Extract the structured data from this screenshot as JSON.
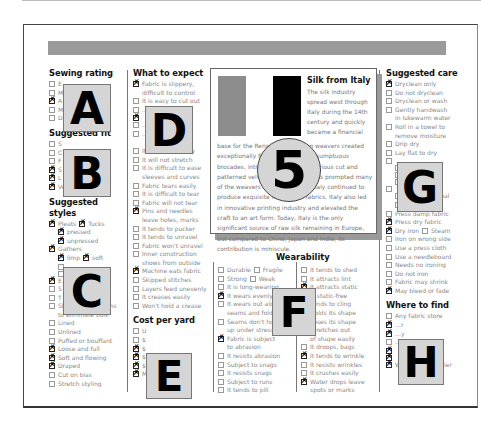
{
  "page": {
    "header_bar_color": "#9a9a9a"
  },
  "sewing_rating": {
    "title": "Sewing rating",
    "items": [
      {
        "label": "E",
        "checked": false
      },
      {
        "label": "M",
        "checked": false
      },
      {
        "label": "A",
        "checked": true
      },
      {
        "label": "M…ut",
        "checked": false
      },
      {
        "label": "D…s",
        "checked": false
      }
    ]
  },
  "suggested_fit": {
    "title": "Suggested fit",
    "items": [
      {
        "label": "S",
        "checked": false
      },
      {
        "label": "C",
        "checked": false
      },
      {
        "label": "F",
        "checked": false
      },
      {
        "label": "S",
        "checked": true
      },
      {
        "label": "L",
        "checked": true
      },
      {
        "label": "Very loose fitting",
        "checked": true
      }
    ]
  },
  "suggested_styles": {
    "title": "Suggested styles",
    "items": [
      {
        "label": "Pleats",
        "checked": true,
        "pair": {
          "label": "Tucks",
          "checked": true
        }
      },
      {
        "label": "pressed",
        "checked": true,
        "indent": true
      },
      {
        "label": "unpressed",
        "checked": true,
        "indent": true
      },
      {
        "label": "Gathers",
        "checked": true
      },
      {
        "label": "limp",
        "checked": true,
        "indent": true,
        "pair": {
          "label": "soft",
          "checked": true
        }
      },
      {
        "label": "",
        "checked": false,
        "indent": true
      },
      {
        "label": "",
        "checked": false,
        "indent": true
      },
      {
        "label": "E…ng",
        "checked": true
      },
      {
        "label": "S",
        "checked": false
      },
      {
        "label": "T",
        "checked": false
      },
      {
        "label": "Shaped with seams",
        "checked": false,
        "cont": "to eliminate bulk"
      },
      {
        "label": "Lined",
        "checked": false
      },
      {
        "label": "Unlined",
        "checked": false
      },
      {
        "label": "Puffed or bouffant",
        "checked": false
      },
      {
        "label": "Loose and full",
        "checked": true
      },
      {
        "label": "Soft and flowing",
        "checked": true
      },
      {
        "label": "Draped",
        "checked": true
      },
      {
        "label": "Cut on bias",
        "checked": false
      },
      {
        "label": "Stretch styling",
        "checked": false
      }
    ]
  },
  "what_to_expect": {
    "title": "What to expect",
    "items": [
      {
        "label": "Fabric is slippery,",
        "checked": true,
        "cont": "difficult to control"
      },
      {
        "label": "It is easy to cut out",
        "checked": false
      },
      {
        "label": "…ut",
        "checked": false
      },
      {
        "label": "",
        "checked": true
      },
      {
        "label": "…te",
        "checked": false
      },
      {
        "label": "…ric",
        "checked": false,
        "cont": ""
      },
      {
        "label": "It stretches easily",
        "checked": false
      },
      {
        "label": "It will not stretch",
        "checked": false
      },
      {
        "label": "It is difficult to ease",
        "checked": false,
        "cont": "sleeves and curves"
      },
      {
        "label": "Fabric tears easily",
        "checked": false
      },
      {
        "label": "It is difficult to tear",
        "checked": false
      },
      {
        "label": "Fabric will not tear",
        "checked": false
      },
      {
        "label": "Pins and needles",
        "checked": true,
        "cont": "leave holes, marks"
      },
      {
        "label": "It tends to pucker",
        "checked": false
      },
      {
        "label": "It tends to unravel",
        "checked": false
      },
      {
        "label": "Fabric won't unravel",
        "checked": false
      },
      {
        "label": "Inner construction",
        "checked": false,
        "cont": "shows from outside"
      },
      {
        "label": "Machine eats fabric",
        "checked": true
      },
      {
        "label": "Skipped stitches",
        "checked": false
      },
      {
        "label": "Layers feed unevenly",
        "checked": false
      },
      {
        "label": "It creases easily",
        "checked": false
      },
      {
        "label": "Won't hold a crease",
        "checked": false
      }
    ]
  },
  "cost_per_yard": {
    "title": "Cost per yard",
    "items": [
      {
        "label": "U",
        "checked": false
      },
      {
        "label": "$",
        "checked": false
      },
      {
        "label": "$",
        "checked": true
      },
      {
        "label": "$",
        "checked": true
      },
      {
        "label": "$",
        "checked": true
      },
      {
        "label": "More than $50",
        "checked": true
      }
    ]
  },
  "feature": {
    "title": "Silk from Italy",
    "flag_colors": [
      "#8c8c8c",
      "#ffffff",
      "#000000"
    ],
    "intro": "The silk industry spread west through Italy during the 14th century and quickly became a financial",
    "body": "base for the Renaissance. Italian weavers created exceptionally fine silks, including sumptuous brocades, intricate jacquards, luxurious cut and patterned velvets. Wars and politics prompted many of the weavers to emigrate, but Italy continued to produce exquisite fine woven fabrics. Italy also led in innovative printing industry and elevated the craft to an art form. Today, Italy is the only significant source of raw silk remaining in Europe, but compared to China, Japan and India, its contribution is miniscule."
  },
  "wearability": {
    "title": "Wearability",
    "left": [
      {
        "label": "Durable",
        "checked": false,
        "pair": {
          "label": "Fragile",
          "checked": false
        }
      },
      {
        "label": "Strong",
        "checked": false,
        "pair": {
          "label": "Weak",
          "checked": false
        }
      },
      {
        "label": "It is long-wearing",
        "checked": false
      },
      {
        "label": "It wears evenly",
        "checked": true
      },
      {
        "label": "It wears out along",
        "checked": false,
        "cont": "seams and folds"
      },
      {
        "label": "Seams don't hold",
        "checked": false,
        "cont": "up under stress"
      },
      {
        "label": "Fabric is subject",
        "checked": true,
        "cont": "to abrasion"
      },
      {
        "label": "It resists abrasion",
        "checked": false
      },
      {
        "label": "Subject to snags",
        "checked": false
      },
      {
        "label": "It resists snags",
        "checked": false
      },
      {
        "label": "Subject to runs",
        "checked": false
      },
      {
        "label": "It tends to pill",
        "checked": false
      }
    ],
    "right": [
      {
        "label": "It tends to shed",
        "checked": false
      },
      {
        "label": "It attracts lint",
        "checked": false
      },
      {
        "label": "It attracts static",
        "checked": true
      },
      {
        "label": "Is static-free",
        "checked": false
      },
      {
        "label": "Tends to cling",
        "checked": true
      },
      {
        "label": "Holds its shape",
        "checked": true
      },
      {
        "label": "Loses its shape",
        "checked": false
      },
      {
        "label": "Stretches out",
        "checked": false,
        "cont": "of shape easily"
      },
      {
        "label": "It droops, bags",
        "checked": false
      },
      {
        "label": "It tends to wrinkle",
        "checked": true
      },
      {
        "label": "It resists wrinkles",
        "checked": false
      },
      {
        "label": "It crushes easily",
        "checked": false
      },
      {
        "label": "Water drops leave",
        "checked": true,
        "cont": "spots or marks"
      }
    ]
  },
  "suggested_care": {
    "title": "Suggested care",
    "items": [
      {
        "label": "Dryclean only",
        "checked": true
      },
      {
        "label": "Do not dryclean",
        "checked": false
      },
      {
        "label": "Dryclean or wash",
        "checked": false
      },
      {
        "label": "Gently handwash",
        "checked": false,
        "cont": "in lukewarm water"
      },
      {
        "label": "Roll in a towel to",
        "checked": false,
        "cont": "remove moisture"
      },
      {
        "label": "Drip dry",
        "checked": false
      },
      {
        "label": "Lay flat to dry",
        "checked": false
      },
      {
        "label": "",
        "checked": false
      },
      {
        "label": "",
        "checked": false,
        "indent": true
      },
      {
        "label": "",
        "checked": false,
        "indent": true
      },
      {
        "label": "",
        "checked": false,
        "indent": true
      },
      {
        "label": "",
        "checked": false
      },
      {
        "label": "cool",
        "checked": false,
        "indent": true,
        "pair": {
          "label": "normal",
          "checked": false
        }
      },
      {
        "label": "perm. press",
        "checked": false,
        "indent": true
      },
      {
        "label": "Press damp fabric",
        "checked": false
      },
      {
        "label": "Press dry fabric",
        "checked": true
      },
      {
        "label": "Dry iron",
        "checked": true,
        "pair": {
          "label": "Steam",
          "checked": false
        }
      },
      {
        "label": "Iron on wrong side",
        "checked": false
      },
      {
        "label": "Use a press cloth",
        "checked": false
      },
      {
        "label": "Use a needleboard",
        "checked": false
      },
      {
        "label": "Needs no ironing",
        "checked": false
      },
      {
        "label": "Do not iron",
        "checked": false
      },
      {
        "label": "Fabric may shrink",
        "checked": false
      },
      {
        "label": "May bleed or fade",
        "checked": true
      }
    ]
  },
  "where_to_find": {
    "title": "Where to find",
    "items": [
      {
        "label": "Any fabric store",
        "checked": false
      },
      {
        "label": "…r",
        "checked": true
      },
      {
        "label": "…y",
        "checked": true
      },
      {
        "label": "…c",
        "checked": false,
        "blank": true
      },
      {
        "label": "",
        "checked": true
      },
      {
        "label": "",
        "checked": true
      },
      {
        "label": "Wholesale supplier",
        "checked": true
      }
    ]
  },
  "overlays": [
    {
      "label": "A"
    },
    {
      "label": "B"
    },
    {
      "label": "C"
    },
    {
      "label": "D"
    },
    {
      "label": "5"
    },
    {
      "label": "F"
    },
    {
      "label": "G"
    },
    {
      "label": "E"
    },
    {
      "label": "H"
    }
  ]
}
